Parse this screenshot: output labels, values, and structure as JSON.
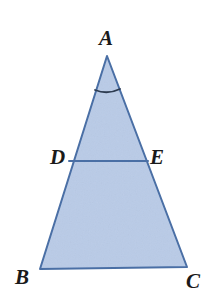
{
  "figure": {
    "canvas": {
      "width": 212,
      "height": 308,
      "background": "#ffffff"
    },
    "style": {
      "fill_color": "#b9cbe7",
      "stroke_color": "#4a6fa5",
      "arc_color": "#2d3b50",
      "label_color": "#1a1a1a",
      "stroke_width": 2
    },
    "points": {
      "A": {
        "x": 107,
        "y": 56
      },
      "B": {
        "x": 40,
        "y": 269
      },
      "C": {
        "x": 187,
        "y": 267
      },
      "D": {
        "x": 69,
        "y": 161
      },
      "E": {
        "x": 148,
        "y": 161
      }
    },
    "labels": {
      "A": "A",
      "B": "B",
      "C": "C",
      "D": "D",
      "E": "E"
    },
    "segments": [
      {
        "name": "side-AB",
        "from": "A",
        "to": "B"
      },
      {
        "name": "side-AC",
        "from": "A",
        "to": "C"
      },
      {
        "name": "side-BC",
        "from": "B",
        "to": "C"
      },
      {
        "name": "segment-DE",
        "from": "D",
        "to": "E"
      }
    ],
    "angle_marks": [
      {
        "name": "angle-mark-A",
        "at": "A",
        "arc_path": "M 95 90 Q 107.5 95 120 89"
      }
    ],
    "polygon_points": "107,56 187,267 40,269"
  }
}
